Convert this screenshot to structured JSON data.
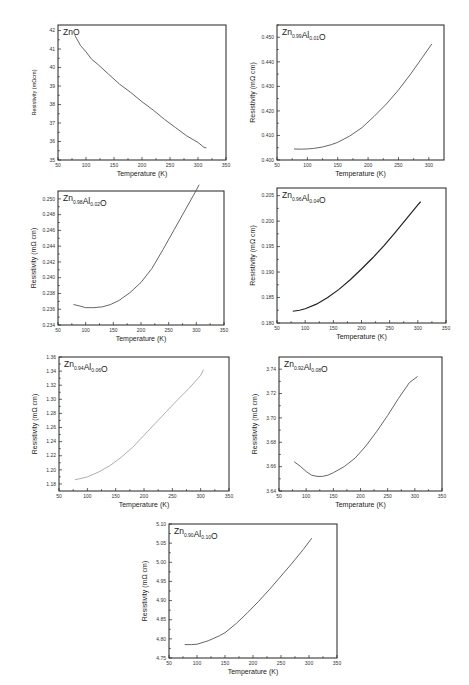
{
  "figure": {
    "panels": [
      {
        "id": "p1",
        "title": "ZnO",
        "title_main": "ZnO",
        "title_parts": [],
        "xlabel": "Temperature (K)",
        "ylabel": "Resistivity (mΩcm)"
      },
      {
        "id": "p2",
        "title": "Zn0.99Al0.01O",
        "xlabel": "Temperature (K)",
        "ylabel": "Resistivity (mΩ cm)"
      },
      {
        "id": "p3",
        "title": "Zn0.98Al0.02O",
        "xlabel": "Temperature (K)",
        "ylabel": "Resistivity (mΩ cm)"
      },
      {
        "id": "p4",
        "title": "Zn0.96Al0.04O",
        "xlabel": "Temperature (K)",
        "ylabel": "Resistivity (mΩ cm)"
      },
      {
        "id": "p5",
        "title": "Zn0.94Al0.06O",
        "xlabel": "Temperature (K)",
        "ylabel": "Resistivity (mΩ cm)"
      },
      {
        "id": "p6",
        "title": "Zn0.92Al0.08O",
        "xlabel": "Temperature (K)",
        "ylabel": "Resistivity (mΩ cm)"
      },
      {
        "id": "p7",
        "title": "Zn0.90Al0.10O",
        "xlabel": "Temperature (K)",
        "ylabel": "Resistivity (mΩ cm)"
      }
    ]
  },
  "chart_data": [
    {
      "type": "line",
      "title": "ZnO",
      "title_sub": {
        "zn": "",
        "al": ""
      },
      "xlabel": "Temperature (K)",
      "ylabel": "Resistivity (mΩcm)",
      "xlim": [
        50,
        350
      ],
      "ylim": [
        35,
        42.3
      ],
      "xticks": [
        50,
        100,
        150,
        200,
        250,
        300,
        350
      ],
      "yticks": [
        35,
        36,
        37,
        38,
        39,
        40,
        41,
        42
      ],
      "grid": false,
      "x": [
        80,
        90,
        100,
        110,
        120,
        140,
        160,
        180,
        200,
        220,
        240,
        260,
        280,
        300,
        310,
        315
      ],
      "values": [
        41.75,
        41.2,
        40.85,
        40.45,
        40.2,
        39.65,
        39.1,
        38.65,
        38.15,
        37.7,
        37.2,
        36.75,
        36.3,
        35.95,
        35.7,
        35.65
      ]
    },
    {
      "type": "line",
      "title": "Zn0.99Al0.01O",
      "title_sub": {
        "zn": "0.99",
        "al": "0.01"
      },
      "xlabel": "Temperature (K)",
      "ylabel": "Resistivity (mΩ cm)",
      "xlim": [
        50,
        325
      ],
      "ylim": [
        0.4,
        0.455
      ],
      "xticks": [
        50,
        100,
        150,
        200,
        250,
        300
      ],
      "yticks": [
        0.4,
        0.41,
        0.42,
        0.43,
        0.44,
        0.45
      ],
      "grid": false,
      "x": [
        78,
        90,
        100,
        110,
        125,
        140,
        150,
        170,
        190,
        210,
        230,
        250,
        270,
        290,
        305
      ],
      "values": [
        0.4045,
        0.4044,
        0.4045,
        0.4047,
        0.4053,
        0.4063,
        0.4072,
        0.4098,
        0.4132,
        0.4178,
        0.4228,
        0.4285,
        0.435,
        0.442,
        0.4473
      ]
    },
    {
      "type": "line",
      "title": "Zn0.98Al0.02O",
      "title_sub": {
        "zn": "0.98",
        "al": "0.02"
      },
      "xlabel": "Temperature (K)",
      "ylabel": "Resistivity (mΩ cm)",
      "xlim": [
        50,
        350
      ],
      "ylim": [
        0.234,
        0.251
      ],
      "xticks": [
        50,
        100,
        150,
        200,
        250,
        300,
        350
      ],
      "yticks": [
        0.234,
        0.236,
        0.238,
        0.24,
        0.242,
        0.244,
        0.246,
        0.248,
        0.25
      ],
      "grid": false,
      "x": [
        78,
        90,
        100,
        115,
        130,
        145,
        160,
        180,
        200,
        220,
        240,
        260,
        280,
        300,
        305
      ],
      "values": [
        0.2366,
        0.2364,
        0.2362,
        0.2362,
        0.2363,
        0.2366,
        0.2371,
        0.2381,
        0.2394,
        0.2412,
        0.2436,
        0.2461,
        0.2486,
        0.2511,
        0.2518
      ]
    },
    {
      "type": "line",
      "title": "Zn0.96Al0.04O",
      "title_sub": {
        "zn": "0.96",
        "al": "0.04"
      },
      "xlabel": "Temperature (K)",
      "ylabel": "Resistivity (mΩ cm)",
      "xlim": [
        50,
        350
      ],
      "ylim": [
        0.18,
        0.2065
      ],
      "xticks": [
        50,
        100,
        150,
        200,
        250,
        300,
        350
      ],
      "yticks": [
        0.18,
        0.185,
        0.19,
        0.195,
        0.2,
        0.205
      ],
      "grid": false,
      "x": [
        78,
        90,
        100,
        120,
        140,
        160,
        180,
        200,
        220,
        240,
        260,
        280,
        300,
        305
      ],
      "values": [
        0.1823,
        0.1825,
        0.1828,
        0.1837,
        0.185,
        0.1866,
        0.1885,
        0.1906,
        0.1928,
        0.1952,
        0.1978,
        0.2005,
        0.2032,
        0.2038
      ]
    },
    {
      "type": "line",
      "title": "Zn0.94Al0.06O",
      "title_sub": {
        "zn": "0.94",
        "al": "0.06"
      },
      "xlabel": "Temperature (K)",
      "ylabel": "Resistivity (mΩ cm)",
      "xlim": [
        50,
        350
      ],
      "ylim": [
        1.17,
        1.36
      ],
      "xticks": [
        50,
        100,
        150,
        200,
        250,
        300,
        350
      ],
      "yticks": [
        1.18,
        1.2,
        1.22,
        1.24,
        1.26,
        1.28,
        1.3,
        1.32,
        1.34,
        1.36
      ],
      "grid": false,
      "x": [
        78,
        90,
        100,
        120,
        140,
        160,
        180,
        200,
        220,
        240,
        260,
        280,
        300,
        305
      ],
      "values": [
        1.186,
        1.188,
        1.19,
        1.197,
        1.206,
        1.218,
        1.232,
        1.249,
        1.266,
        1.283,
        1.3,
        1.316,
        1.334,
        1.342
      ]
    },
    {
      "type": "line",
      "title": "Zn0.92Al0.08O",
      "title_sub": {
        "zn": "0.92",
        "al": "0.08"
      },
      "xlabel": "Temperature (K)",
      "ylabel": "Resistivity (mΩ cm)",
      "xlim": [
        50,
        350
      ],
      "ylim": [
        3.64,
        3.75
      ],
      "xticks": [
        50,
        100,
        150,
        200,
        250,
        300,
        350
      ],
      "yticks": [
        3.64,
        3.66,
        3.68,
        3.7,
        3.72,
        3.74
      ],
      "grid": false,
      "ytick_labels": [
        "3.64",
        "3.66",
        "3.68",
        "3.70",
        "3.72",
        "3.74"
      ],
      "x": [
        78,
        90,
        100,
        110,
        120,
        130,
        140,
        150,
        170,
        190,
        210,
        230,
        250,
        270,
        290,
        305
      ],
      "values": [
        3.664,
        3.66,
        3.656,
        3.653,
        3.652,
        3.652,
        3.653,
        3.655,
        3.66,
        3.667,
        3.677,
        3.689,
        3.702,
        3.716,
        3.729,
        3.734
      ]
    },
    {
      "type": "line",
      "title": "Zn0.90Al0.10O",
      "title_sub": {
        "zn": "0.90",
        "al": "0.10"
      },
      "xlabel": "Temperature (K)",
      "ylabel": "Resistivity (mΩ cm)",
      "xlim": [
        50,
        350
      ],
      "ylim": [
        4.75,
        5.1
      ],
      "xticks": [
        50,
        100,
        150,
        200,
        250,
        300,
        350
      ],
      "yticks": [
        4.75,
        4.8,
        4.85,
        4.9,
        4.95,
        5.0,
        5.05,
        5.1
      ],
      "grid": false,
      "x": [
        78,
        90,
        100,
        120,
        140,
        150,
        170,
        190,
        210,
        230,
        250,
        270,
        290,
        305
      ],
      "values": [
        4.785,
        4.785,
        4.786,
        4.795,
        4.808,
        4.816,
        4.84,
        4.868,
        4.898,
        4.93,
        4.964,
        4.998,
        5.034,
        5.063
      ]
    }
  ],
  "layout": {
    "panels": [
      {
        "left": 58,
        "top": 25,
        "w": 168,
        "h": 135,
        "style": "normal"
      },
      {
        "left": 277,
        "top": 25,
        "w": 167,
        "h": 135,
        "style": "normal"
      },
      {
        "left": 58,
        "top": 191,
        "w": 166,
        "h": 134,
        "style": "normal"
      },
      {
        "left": 277,
        "top": 188,
        "w": 169,
        "h": 135,
        "style": "dark"
      },
      {
        "left": 59,
        "top": 357,
        "w": 170,
        "h": 134,
        "style": "light"
      },
      {
        "left": 279,
        "top": 357,
        "w": 163,
        "h": 134,
        "style": "normal"
      },
      {
        "left": 169,
        "top": 524,
        "w": 168,
        "h": 134,
        "style": "normal"
      }
    ]
  }
}
